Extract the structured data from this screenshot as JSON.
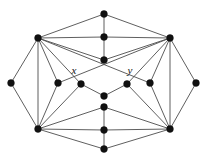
{
  "figure": {
    "name": "graph-diagram",
    "width": 207,
    "height": 163,
    "background": "#ffffff",
    "edge_color": "#4d4d4d",
    "vertex_color": "#111111"
  },
  "graph_data": {
    "type": "graph",
    "vertex_count": 16,
    "edge_count": 38,
    "labeled_vertices": [
      "x",
      "y"
    ],
    "vertices": [
      {
        "id": "t_apex",
        "x": 104,
        "y": 14,
        "label": ""
      },
      {
        "id": "l_hub",
        "x": 38,
        "y": 38,
        "label": ""
      },
      {
        "id": "c_top",
        "x": 104,
        "y": 37,
        "label": ""
      },
      {
        "id": "r_hub",
        "x": 170,
        "y": 38,
        "label": ""
      },
      {
        "id": "c_up",
        "x": 104,
        "y": 60,
        "label": ""
      },
      {
        "id": "far_l",
        "x": 11,
        "y": 83,
        "label": ""
      },
      {
        "id": "in_l",
        "x": 58,
        "y": 83,
        "label": ""
      },
      {
        "id": "x_node",
        "x": 81,
        "y": 84,
        "label": "x"
      },
      {
        "id": "y_node",
        "x": 127,
        "y": 84,
        "label": "y"
      },
      {
        "id": "in_r",
        "x": 150,
        "y": 83,
        "label": ""
      },
      {
        "id": "far_r",
        "x": 196,
        "y": 83,
        "label": ""
      },
      {
        "id": "c_mid",
        "x": 104,
        "y": 96,
        "label": ""
      },
      {
        "id": "c_low",
        "x": 104,
        "y": 107,
        "label": ""
      },
      {
        "id": "l_hub_b",
        "x": 38,
        "y": 129,
        "label": ""
      },
      {
        "id": "c_bot",
        "x": 104,
        "y": 130,
        "label": ""
      },
      {
        "id": "r_hub_b",
        "x": 170,
        "y": 129,
        "label": ""
      },
      {
        "id": "b_apex",
        "x": 104,
        "y": 149,
        "label": ""
      }
    ],
    "edges": [
      [
        "t_apex",
        "l_hub"
      ],
      [
        "t_apex",
        "r_hub"
      ],
      [
        "t_apex",
        "c_top"
      ],
      [
        "l_hub",
        "c_top"
      ],
      [
        "c_top",
        "r_hub"
      ],
      [
        "l_hub",
        "c_up"
      ],
      [
        "c_up",
        "r_hub"
      ],
      [
        "c_top",
        "c_up"
      ],
      [
        "l_hub",
        "far_l"
      ],
      [
        "l_hub",
        "in_l"
      ],
      [
        "l_hub",
        "x_node"
      ],
      [
        "l_hub",
        "l_hub_b"
      ],
      [
        "r_hub",
        "far_r"
      ],
      [
        "r_hub",
        "in_r"
      ],
      [
        "r_hub",
        "y_node"
      ],
      [
        "r_hub",
        "r_hub_b"
      ],
      [
        "far_l",
        "l_hub_b"
      ],
      [
        "in_l",
        "l_hub_b"
      ],
      [
        "x_node",
        "l_hub_b"
      ],
      [
        "far_r",
        "r_hub_b"
      ],
      [
        "in_r",
        "r_hub_b"
      ],
      [
        "y_node",
        "r_hub_b"
      ],
      [
        "x_node",
        "c_mid"
      ],
      [
        "y_node",
        "c_mid"
      ],
      [
        "l_hub_b",
        "c_low"
      ],
      [
        "c_low",
        "r_hub_b"
      ],
      [
        "l_hub_b",
        "c_bot"
      ],
      [
        "c_bot",
        "r_hub_b"
      ],
      [
        "c_low",
        "c_bot"
      ],
      [
        "l_hub_b",
        "b_apex"
      ],
      [
        "b_apex",
        "r_hub_b"
      ],
      [
        "c_bot",
        "b_apex"
      ],
      [
        "l_hub",
        "in_r"
      ],
      [
        "r_hub",
        "in_l"
      ]
    ],
    "labels": [
      {
        "text": "x",
        "x": 74,
        "y": 74,
        "for": "x_node"
      },
      {
        "text": "y",
        "x": 130,
        "y": 74,
        "for": "y_node"
      }
    ]
  }
}
